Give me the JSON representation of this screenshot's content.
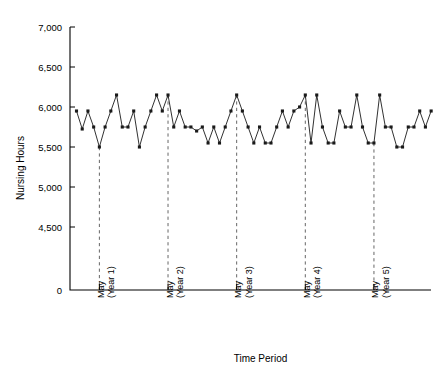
{
  "chart_data": {
    "type": "line",
    "title": "",
    "subtitle": "",
    "xlabel": "Time Period",
    "ylabel": "Nursing Hours",
    "grid": false,
    "legend": null,
    "legend_position": "none",
    "ylim": [
      4400,
      7000
    ],
    "y_axis_broken": true,
    "y_break_note": "axis jumps from 0 to 4,500",
    "ytick_labels": [
      "7,000",
      "6,500",
      "6,000",
      "5,500",
      "5,000",
      "4,500",
      "0"
    ],
    "ytick_values": [
      7000,
      6500,
      6000,
      5500,
      5000,
      4500,
      0
    ],
    "xtick_labels": [
      "May\n(Year 1)",
      "May\n(Year 2)",
      "May\n(Year 3)",
      "May\n(Year 4)",
      "May\n(Year 5)"
    ],
    "xtick_labels_line1": [
      "May",
      "May",
      "May",
      "May",
      "May"
    ],
    "xtick_labels_line2": [
      "(Year 1)",
      "(Year 2)",
      "(Year 3)",
      "(Year 4)",
      "(Year 5)"
    ],
    "xtick_indices": [
      4,
      16,
      28,
      40,
      52
    ],
    "annotations": [
      {
        "type": "vertical-dashed-line",
        "at_label": "May (Year 1)",
        "index": 4
      },
      {
        "type": "vertical-dashed-line",
        "at_label": "May (Year 2)",
        "index": 16
      },
      {
        "type": "vertical-dashed-line",
        "at_label": "May (Year 3)",
        "index": 28
      },
      {
        "type": "vertical-dashed-line",
        "at_label": "May (Year 4)",
        "index": 40
      },
      {
        "type": "vertical-dashed-line",
        "at_label": "May (Year 5)",
        "index": 52
      }
    ],
    "series": [
      {
        "name": "Nursing Hours",
        "marker": "square",
        "color": "#1a1a1a",
        "values": [
          5950,
          5725,
          5950,
          5750,
          5500,
          5750,
          5950,
          6150,
          5750,
          5750,
          5950,
          5500,
          5750,
          5950,
          6150,
          5950,
          6150,
          5750,
          5950,
          5750,
          5750,
          5700,
          5750,
          5550,
          5750,
          5550,
          5750,
          5950,
          6150,
          5950,
          5750,
          5550,
          5750,
          5550,
          5550,
          5750,
          5950,
          5750,
          5950,
          6000,
          6150,
          5550,
          6150,
          5750,
          5550,
          5550,
          5950,
          5750,
          5750,
          6150,
          5750,
          5550,
          5550,
          6150,
          5750,
          5750,
          5500,
          5500,
          5750,
          5750,
          5950,
          5750,
          5950
        ]
      }
    ]
  }
}
